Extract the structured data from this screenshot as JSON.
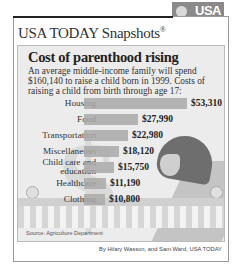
{
  "header": {
    "brand": "USA TODAY Snapshots",
    "registered": "®",
    "logo_line1": "USA",
    "logo_line2": "TODAY"
  },
  "headline": "Cost of parenthood rising",
  "subhead": "An average middle-income family will spend $160,140 to raise a child born in 1999. Costs of raising a child from birth through age 17:",
  "source": "Source: Agriculture Department",
  "byline": "By Hilary Wasson, and Sam Ward, USA TODAY",
  "chart_data": {
    "type": "bar",
    "orientation": "horizontal",
    "title": "Cost of parenthood rising",
    "subtitle": "An average middle-income family will spend $160,140 to raise a child born in 1999. Costs of raising a child from birth through age 17:",
    "categories": [
      "Housing",
      "Food",
      "Transportation",
      "Miscellaneous",
      "Child care and education",
      "Healthcare",
      "Clothing"
    ],
    "values": [
      53310,
      27990,
      22980,
      18120,
      15750,
      11190,
      10800
    ],
    "value_labels": [
      "$53,310",
      "$27,990",
      "$22,980",
      "$18,120",
      "$15,750",
      "$11,190",
      "$10,800"
    ],
    "xlabel": "",
    "ylabel": "",
    "grid": false,
    "legend": "none",
    "units": "USD",
    "bar_color": "#a9a9a9"
  },
  "rows": [
    {
      "label": "Housing",
      "value": "$53,310",
      "width": 103,
      "top": 52
    },
    {
      "label": "Food",
      "value": "$27,990",
      "width": 54,
      "top": 68
    },
    {
      "label": "Transportation",
      "value": "$22,980",
      "width": 44,
      "top": 84
    },
    {
      "label": "Miscellaneous",
      "value": "$18,120",
      "width": 35,
      "top": 100
    },
    {
      "label": "Child care and education",
      "value": "$15,750",
      "width": 30,
      "top": 116
    },
    {
      "label": "Healthcare",
      "value": "$11,190",
      "width": 22,
      "top": 132
    },
    {
      "label": "Clothing",
      "value": "$10,800",
      "width": 21,
      "top": 148
    }
  ]
}
